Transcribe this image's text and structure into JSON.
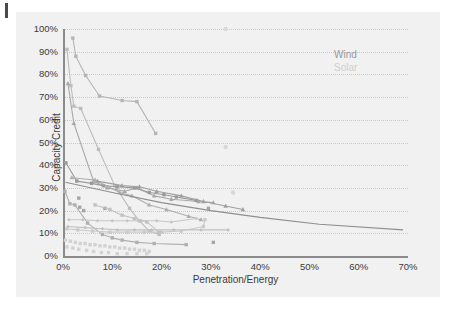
{
  "figure": {
    "background": "#f1f1f1",
    "page_background": "#ffffff"
  },
  "legend": {
    "position": "top-right",
    "entries": [
      {
        "label": "Wind",
        "color": "#9a9a9a"
      },
      {
        "label": "Solar",
        "color": "#cfcfcf"
      }
    ]
  },
  "axes": {
    "x": {
      "label": "Penetration/Energy",
      "ticks": [
        "0%",
        "10%",
        "20%",
        "30%",
        "40%",
        "50%",
        "60%",
        "70%"
      ],
      "values": [
        0,
        10,
        20,
        30,
        40,
        50,
        60,
        70
      ],
      "min": 0,
      "max": 70
    },
    "y": {
      "label": "Capacity Credit",
      "ticks": [
        "0%",
        "10%",
        "20%",
        "30%",
        "40%",
        "50%",
        "60%",
        "70%",
        "80%",
        "90%",
        "100%"
      ],
      "values": [
        0,
        10,
        20,
        30,
        40,
        50,
        60,
        70,
        80,
        90,
        100
      ],
      "min": 0,
      "max": 100
    },
    "grid": "horizontal-dotted"
  },
  "chart_data": {
    "type": "scatter",
    "title": "",
    "xlabel": "Penetration/Energy",
    "ylabel": "Capacity Credit",
    "xlim": [
      0,
      70
    ],
    "ylim": [
      0,
      100
    ],
    "grid": true,
    "legend_position": "top-right",
    "colors": {
      "wind": "#9a9a9a",
      "solar": "#cfcfcf"
    },
    "series": [
      {
        "name": "wind-high-a",
        "group": "Wind",
        "color": "#b5b5b5",
        "marker": "square",
        "line": true,
        "points": [
          [
            2.0,
            96.0
          ],
          [
            2.6,
            88.0
          ],
          [
            4.6,
            79.5
          ],
          [
            7.4,
            70.5
          ],
          [
            12.0,
            68.5
          ],
          [
            15.0,
            68.0
          ],
          [
            18.8,
            54.0
          ]
        ]
      },
      {
        "name": "wind-high-b",
        "group": "Wind",
        "color": "#bdbdbd",
        "marker": "square",
        "line": true,
        "points": [
          [
            0.8,
            91.0
          ],
          [
            1.6,
            75.0
          ],
          [
            2.2,
            66.0
          ],
          [
            3.6,
            65.0
          ],
          [
            7.2,
            47.0
          ],
          [
            10.5,
            31.0
          ],
          [
            13.5,
            21.0
          ],
          [
            15.5,
            15.5
          ],
          [
            17.5,
            11.0
          ],
          [
            19.5,
            9.5
          ]
        ]
      },
      {
        "name": "wind-high-c",
        "group": "Wind",
        "color": "#a8a8a8",
        "marker": "triangle",
        "line": true,
        "points": [
          [
            1.0,
            76.0
          ],
          [
            2.2,
            58.5
          ],
          [
            6.2,
            33.0
          ],
          [
            9.0,
            30.0
          ],
          [
            12.5,
            28.5
          ],
          [
            15.0,
            30.0
          ],
          [
            18.5,
            26.5
          ],
          [
            22.0,
            25.0
          ],
          [
            27.5,
            24.0
          ],
          [
            30.5,
            23.5
          ]
        ]
      },
      {
        "name": "wind-mid-a",
        "group": "Wind",
        "color": "#9a9a9a",
        "marker": "square",
        "line": true,
        "points": [
          [
            0.6,
            41.0
          ],
          [
            2.8,
            33.0
          ],
          [
            5.8,
            32.0
          ],
          [
            8.2,
            31.0
          ],
          [
            11.0,
            30.5
          ],
          [
            14.5,
            30.0
          ],
          [
            17.5,
            28.0
          ],
          [
            20.5,
            27.0
          ],
          [
            23.0,
            26.0
          ],
          [
            27.0,
            24.5
          ]
        ]
      },
      {
        "name": "wind-mid-b",
        "group": "Wind",
        "color": "#aeaeae",
        "marker": "triangle",
        "line": true,
        "points": [
          [
            1.8,
            34.5
          ],
          [
            6.5,
            33.5
          ],
          [
            11.5,
            28.0
          ],
          [
            14.0,
            26.5
          ],
          [
            17.5,
            22.5
          ],
          [
            21.0,
            20.5
          ],
          [
            25.5,
            17.5
          ],
          [
            28.0,
            16.0
          ]
        ]
      },
      {
        "name": "wind-mid-c",
        "group": "Wind",
        "color": "#a0a0a0",
        "marker": "triangle",
        "line": true,
        "points": [
          [
            7.0,
            33.0
          ],
          [
            12.0,
            31.0
          ],
          [
            15.5,
            30.5
          ],
          [
            19.0,
            28.5
          ],
          [
            24.0,
            26.5
          ],
          [
            28.5,
            24.0
          ],
          [
            33.0,
            22.0
          ],
          [
            36.5,
            20.5
          ]
        ]
      },
      {
        "name": "wind-long-tail",
        "group": "Wind",
        "color": "#8f8f8f",
        "marker": "none",
        "line": true,
        "points": [
          [
            0.5,
            32.5
          ],
          [
            10.0,
            28.0
          ],
          [
            20.0,
            23.5
          ],
          [
            30.0,
            20.0
          ],
          [
            40.0,
            17.0
          ],
          [
            52.0,
            14.0
          ],
          [
            69.0,
            11.5
          ]
        ]
      },
      {
        "name": "wind-steep-drop",
        "group": "Wind",
        "color": "#b0b0b0",
        "marker": "square",
        "line": true,
        "points": [
          [
            0.4,
            28.5
          ],
          [
            1.4,
            23.0
          ],
          [
            2.4,
            22.5
          ],
          [
            5.0,
            14.5
          ],
          [
            8.0,
            9.5
          ],
          [
            10.0,
            8.0
          ],
          [
            12.0,
            7.0
          ],
          [
            15.0,
            6.0
          ],
          [
            18.5,
            5.5
          ],
          [
            25.0,
            5.0
          ]
        ]
      },
      {
        "name": "wind-cluster-25",
        "group": "Wind",
        "color": "#a6a6a6",
        "marker": "square",
        "line": false,
        "points": [
          [
            3.2,
            25.5
          ],
          [
            3.4,
            21.5
          ],
          [
            4.2,
            20.0
          ],
          [
            8.5,
            21.0
          ],
          [
            29.5,
            21.0
          ],
          [
            30.5,
            6.0
          ]
        ]
      },
      {
        "name": "solar-flat-16",
        "group": "Solar",
        "color": "#c6c6c6",
        "marker": "diamond",
        "line": true,
        "points": [
          [
            1.2,
            16.0
          ],
          [
            4.0,
            16.0
          ],
          [
            7.0,
            15.5
          ],
          [
            10.0,
            15.5
          ],
          [
            13.0,
            15.5
          ],
          [
            16.0,
            15.5
          ],
          [
            19.0,
            15.5
          ],
          [
            22.0,
            15.0
          ],
          [
            27.0,
            16.5
          ]
        ]
      },
      {
        "name": "solar-flat-12",
        "group": "Solar",
        "color": "#c0c0c0",
        "marker": "diamond",
        "line": true,
        "points": [
          [
            1.0,
            13.0
          ],
          [
            4.5,
            12.5
          ],
          [
            8.0,
            12.0
          ],
          [
            11.0,
            11.5
          ],
          [
            14.5,
            11.5
          ],
          [
            18.0,
            11.5
          ],
          [
            22.5,
            11.5
          ],
          [
            28.0,
            11.5
          ],
          [
            33.5,
            11.5
          ]
        ]
      },
      {
        "name": "solar-flat-11",
        "group": "Solar",
        "color": "#cacaca",
        "marker": "square",
        "line": true,
        "points": [
          [
            0.8,
            12.0
          ],
          [
            3.0,
            11.5
          ],
          [
            6.0,
            11.0
          ],
          [
            9.5,
            10.5
          ],
          [
            13.0,
            10.5
          ],
          [
            16.5,
            10.5
          ],
          [
            20.0,
            10.5
          ],
          [
            24.0,
            11.0
          ],
          [
            28.5,
            13.0
          ],
          [
            28.8,
            16.0
          ]
        ]
      },
      {
        "name": "solar-slope-22",
        "group": "Solar",
        "color": "#c2c2c2",
        "marker": "square",
        "line": true,
        "points": [
          [
            6.5,
            22.5
          ],
          [
            9.5,
            20.5
          ],
          [
            12.0,
            18.0
          ],
          [
            14.5,
            16.5
          ],
          [
            17.0,
            15.0
          ],
          [
            19.5,
            10.5
          ]
        ]
      },
      {
        "name": "solar-band",
        "group": "Solar",
        "color": "#d2d2d2",
        "marker": "square",
        "line": false,
        "points": [
          [
            0.5,
            7.0
          ],
          [
            1.5,
            6.5
          ],
          [
            2.5,
            6.0
          ],
          [
            3.5,
            5.5
          ],
          [
            4.5,
            5.5
          ],
          [
            5.5,
            5.0
          ],
          [
            6.5,
            5.0
          ],
          [
            7.5,
            4.5
          ],
          [
            8.5,
            4.5
          ],
          [
            9.5,
            4.0
          ],
          [
            10.5,
            4.0
          ],
          [
            11.5,
            3.5
          ],
          [
            12.5,
            3.5
          ],
          [
            13.5,
            3.0
          ],
          [
            14.5,
            3.0
          ],
          [
            15.5,
            2.5
          ],
          [
            16.5,
            2.5
          ],
          [
            17.5,
            2.0
          ],
          [
            0.8,
            4.0
          ],
          [
            2.0,
            3.5
          ],
          [
            3.2,
            3.0
          ],
          [
            4.8,
            2.5
          ],
          [
            6.2,
            2.0
          ],
          [
            7.8,
            1.5
          ],
          [
            9.2,
            1.5
          ],
          [
            11.0,
            1.0
          ],
          [
            13.0,
            1.0
          ],
          [
            15.0,
            1.0
          ],
          [
            17.0,
            1.0
          ]
        ]
      },
      {
        "name": "solar-outliers",
        "group": "Solar",
        "color": "#d8d8d8",
        "marker": "circle",
        "line": false,
        "points": [
          [
            33.0,
            100.0
          ],
          [
            33.0,
            48.0
          ],
          [
            34.5,
            28.0
          ]
        ]
      }
    ]
  }
}
